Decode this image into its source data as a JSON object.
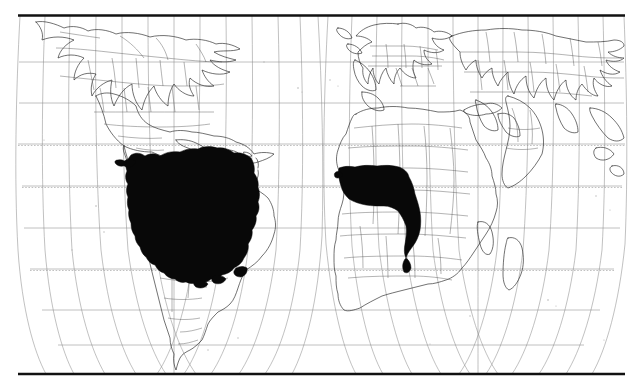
{
  "figure": {
    "kind": "world-distribution-map",
    "title": "",
    "projection": "interrupted sinusoidal (two lobes)",
    "background_color": "#ffffff",
    "frame_color": "#111111",
    "graticule_color": "#8d8d8d",
    "coastline_color": "#1a1a1a",
    "range_color": "#080808"
  },
  "frame": {
    "left": 18,
    "top": 15,
    "right": 625,
    "bottom": 374,
    "label": "map-frame"
  },
  "graticule": {
    "parallel_interval_degrees": 15,
    "meridian_interval_degrees": 15,
    "equator_style": "dotted",
    "parallels": [
      60,
      45,
      30,
      15,
      0,
      -15,
      -30,
      -45,
      -60
    ],
    "lobe_west_center_longitude": -60,
    "lobe_east_center_longitude": 20,
    "interruption_longitude": -20
  },
  "lobes": [
    {
      "name": "western-hemisphere-lobe",
      "center_x": 168,
      "label": "Americas lobe"
    },
    {
      "name": "eastern-hemisphere-lobe",
      "center_x": 448,
      "label": "Africa-Eurasia lobe"
    }
  ],
  "distribution": {
    "legend_label": "shaded range",
    "fill_color": "#080808",
    "regions": [
      {
        "name": "amazonia-range",
        "continent": "South America",
        "description": "Amazon basin and adjacent lowlands"
      },
      {
        "name": "west-central-africa-range",
        "continent": "Africa",
        "description": "Guinean and Congo basin coastal belt"
      }
    ]
  },
  "landmasses": [
    {
      "name": "north-america"
    },
    {
      "name": "south-america"
    },
    {
      "name": "europe"
    },
    {
      "name": "africa"
    },
    {
      "name": "asia"
    },
    {
      "name": "madagascar"
    },
    {
      "name": "caribbean-islands"
    }
  ]
}
